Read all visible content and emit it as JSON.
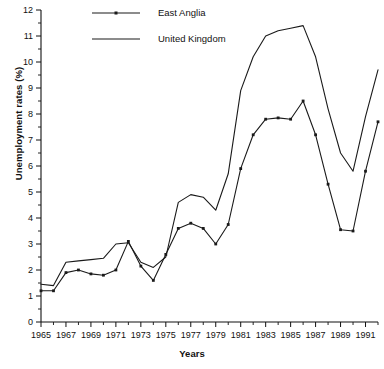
{
  "chart_data": {
    "type": "line",
    "title": "",
    "xlabel": "Years",
    "ylabel": "Unemployment rates (%)",
    "xlim": [
      1965,
      1992
    ],
    "ylim": [
      0,
      12
    ],
    "ytick_step": 1,
    "ytick_minor_step": 0.5,
    "xtick_step": 2,
    "xtick_minor_step": 1,
    "grid": false,
    "legend_position": "top-left-inside",
    "ytick_labels": [
      "0",
      "1",
      "2",
      "3",
      "4",
      "5",
      "6",
      "7",
      "8",
      "9",
      "10",
      "11",
      "12"
    ],
    "xtick_labels": [
      "1965",
      "1967",
      "1969",
      "1971",
      "1973",
      "1975",
      "1977",
      "1979",
      "1981",
      "1983",
      "1985",
      "1987",
      "1989",
      "1991"
    ],
    "x": [
      1965,
      1966,
      1967,
      1968,
      1969,
      1970,
      1971,
      1972,
      1973,
      1974,
      1975,
      1976,
      1977,
      1978,
      1979,
      1980,
      1981,
      1982,
      1983,
      1984,
      1985,
      1986,
      1987,
      1988,
      1989,
      1990,
      1991,
      1992
    ],
    "series": [
      {
        "name": "East Anglia",
        "marker": "square",
        "values": [
          1.2,
          1.2,
          1.9,
          2.0,
          1.85,
          1.8,
          2.0,
          3.1,
          2.15,
          1.6,
          2.6,
          3.6,
          3.8,
          3.6,
          3.0,
          3.75,
          5.9,
          7.2,
          7.8,
          7.85,
          7.8,
          8.5,
          7.2,
          5.3,
          3.55,
          3.5,
          5.8,
          7.7
        ]
      },
      {
        "name": "United Kingdom",
        "marker": "none",
        "values": [
          1.45,
          1.4,
          2.3,
          2.35,
          2.4,
          2.45,
          3.0,
          3.05,
          2.3,
          2.1,
          2.5,
          4.6,
          4.9,
          4.8,
          4.3,
          5.7,
          8.9,
          10.2,
          11.0,
          11.2,
          11.3,
          11.4,
          10.2,
          8.2,
          6.5,
          5.8,
          7.9,
          9.7
        ]
      }
    ],
    "legend": [
      {
        "label": "East Anglia",
        "style": "line-with-marker"
      },
      {
        "label": "United Kingdom",
        "style": "line"
      }
    ],
    "colors": {
      "series": "#1a1a1a",
      "axis": "#111111",
      "background": "#ffffff"
    }
  }
}
